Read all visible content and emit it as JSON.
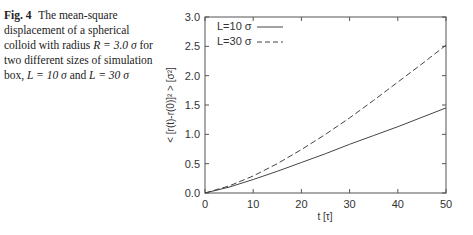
{
  "caption": {
    "label": "Fig. 4",
    "text_parts": [
      "The mean-square displacement of a spherical colloid with radius ",
      "R = 3.0 σ",
      " for two different sizes of simulation box, ",
      "L = 10 σ",
      " and ",
      "L = 30 σ"
    ]
  },
  "chart_data": {
    "type": "line",
    "title": "",
    "xlabel": "t [τ]",
    "ylabel": "< [r(t)-r(0)]² > [σ²]",
    "xlim": [
      0,
      50
    ],
    "ylim": [
      0,
      3.0
    ],
    "xticks": [
      0,
      10,
      20,
      30,
      40,
      50
    ],
    "yticks": [
      0.0,
      0.5,
      1.0,
      1.5,
      2.0,
      2.5,
      3.0
    ],
    "ytick_labels": [
      "0.0",
      "0.5",
      "1.0",
      "1.5",
      "2.0",
      "2.5",
      "3.0"
    ],
    "grid": false,
    "legend_position": "upper left",
    "x": [
      0,
      5,
      10,
      15,
      20,
      25,
      30,
      35,
      40,
      45,
      50
    ],
    "series": [
      {
        "name": "L=10 σ",
        "style": "solid",
        "values": [
          0.0,
          0.1,
          0.23,
          0.37,
          0.52,
          0.67,
          0.83,
          0.98,
          1.13,
          1.29,
          1.45
        ]
      },
      {
        "name": "L=30 σ",
        "style": "dashed",
        "values": [
          0.0,
          0.12,
          0.29,
          0.5,
          0.74,
          1.0,
          1.28,
          1.58,
          1.89,
          2.2,
          2.52
        ]
      }
    ]
  }
}
